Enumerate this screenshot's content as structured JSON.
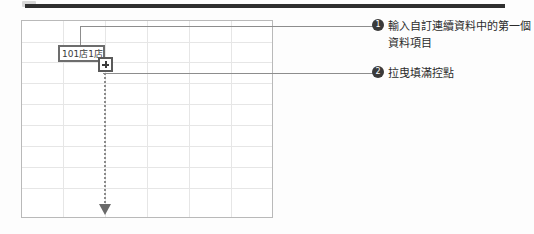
{
  "figure": {
    "type": "spreadsheet-fill-series-illustration",
    "top_rule_color": "#2f2f2f",
    "grid_line_color": "#e6e6e6",
    "grid_border_color": "#b9b9b9"
  },
  "spreadsheet": {
    "selected_cell": {
      "value": "101店1店",
      "border_color": "#6d6d6d"
    },
    "fill_handle": {
      "icon": "crosshair-plus-icon",
      "color": "#3c3c3c"
    },
    "drag_indicator": {
      "icon": "dotted-down-arrow-icon",
      "style": "dotted",
      "direction": "down",
      "color": "#8a8a8a"
    },
    "columns": 6,
    "rows": 9
  },
  "annotations": [
    {
      "number": "❶",
      "marker": "1",
      "text": "輸入自訂連續資料中的第一個資料項目",
      "leader": "line-to-selected-cell"
    },
    {
      "number": "❷",
      "marker": "2",
      "text": "拉曳填滿控點",
      "leader": "line-to-fill-handle"
    }
  ]
}
